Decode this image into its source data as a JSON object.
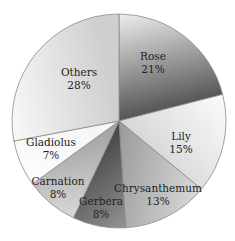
{
  "chart_data": {
    "type": "pie",
    "title": "",
    "start_angle_deg": 0,
    "direction": "clockwise",
    "labels_inside": true,
    "legend": "none",
    "slices": [
      {
        "label": "Rose",
        "value": 21,
        "value_text": "21%",
        "color_from": "#f2f2f2",
        "color_to": "#555555",
        "label_pos": [
          153,
          60
        ]
      },
      {
        "label": "Lily",
        "value": 15,
        "value_text": "15%",
        "color_from": "#ffffff",
        "color_to": "#d6d6d6",
        "label_pos": [
          181,
          140
        ]
      },
      {
        "label": "Chrysanthemum",
        "value": 13,
        "value_text": "13%",
        "color_from": "#e2e2e2",
        "color_to": "#9a9a9a",
        "label_pos": [
          158,
          192
        ]
      },
      {
        "label": "Gerbera",
        "value": 8,
        "value_text": "8%",
        "color_from": "#a8a8a8",
        "color_to": "#444444",
        "label_pos": [
          101,
          205
        ]
      },
      {
        "label": "Carnation",
        "value": 8,
        "value_text": "8%",
        "color_from": "#e8e8e8",
        "color_to": "#a0a0a0",
        "label_pos": [
          58,
          185
        ]
      },
      {
        "label": "Gladiolus",
        "value": 7,
        "value_text": "7%",
        "color_from": "#ffffff",
        "color_to": "#f4f4f4",
        "label_pos": [
          51,
          146
        ]
      },
      {
        "label": "Others",
        "value": 28,
        "value_text": "28%",
        "color_from": "#f8f8f8",
        "color_to": "#cfcfcf",
        "label_pos": [
          79,
          76
        ]
      }
    ]
  },
  "geometry": {
    "cx": 119,
    "cy": 121,
    "r": 107
  }
}
